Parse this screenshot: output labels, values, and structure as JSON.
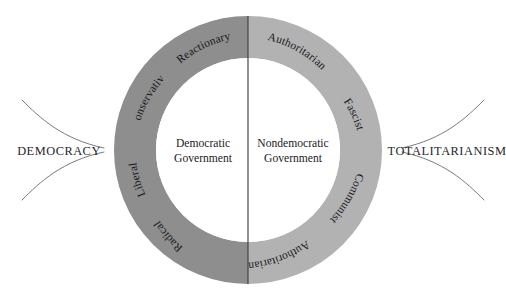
{
  "figure": {
    "type": "diagram",
    "colors": {
      "left_half_ring": "#8e8e8e",
      "right_half_ring": "#b2b2b2",
      "inner_disc": "#ffffff",
      "background": "#ffffff",
      "divider_line": "#3a3a3e",
      "brace_line": "#6b6b70",
      "text": "#17171a"
    }
  },
  "ring": {
    "left_half": {
      "name": "democratic-half",
      "center_label_line1": "Democratic",
      "center_label_line2": "Government",
      "segments": [
        {
          "label": "Reactionary"
        },
        {
          "label": "Conservative"
        },
        {
          "label": "Liberal"
        },
        {
          "label": "Radical"
        }
      ]
    },
    "right_half": {
      "name": "nondemocratic-half",
      "center_label_line1": "Nondemocratic",
      "center_label_line2": "Government",
      "segments": [
        {
          "label": "Authoritarian"
        },
        {
          "label": "Fascist"
        },
        {
          "label": "Communist"
        },
        {
          "label": "Authoritarian"
        }
      ]
    }
  },
  "poles": {
    "left": {
      "label": "DEMOCRACY"
    },
    "right": {
      "label": "TOTALITARIANISM"
    }
  },
  "geometry": {
    "center_x": 248,
    "center_y": 150,
    "outer_radius": 134,
    "inner_radius": 92
  }
}
